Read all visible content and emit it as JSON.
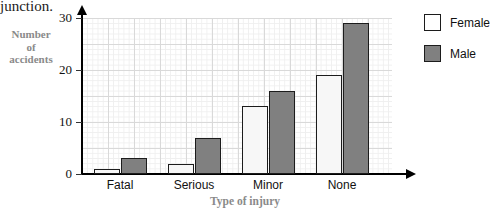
{
  "fragment_text": "junction.",
  "chart_data": {
    "type": "bar",
    "title": "",
    "xlabel": "Type of injury",
    "ylabel": "Number of accidents",
    "ylabel_lines": [
      "Number",
      "of",
      "accidents"
    ],
    "categories": [
      "Fatal",
      "Serious",
      "Minor",
      "None"
    ],
    "series": [
      {
        "name": "Female",
        "color": "#ffffff",
        "values": [
          1,
          2,
          13,
          19
        ]
      },
      {
        "name": "Male",
        "color": "#808080",
        "values": [
          3,
          7,
          16,
          29
        ]
      }
    ],
    "ylim": [
      0,
      30
    ],
    "yticks": [
      0,
      10,
      20,
      30
    ],
    "ytick_labels": [
      "0",
      "10",
      "20",
      "30"
    ],
    "grid": true,
    "grid_major_step": 5,
    "grid_minor_step": 1,
    "legend_position": "right"
  },
  "legend": {
    "items": [
      {
        "label": "Female",
        "swatch": "white-square"
      },
      {
        "label": "Male",
        "swatch": "gray-square"
      }
    ]
  },
  "colors": {
    "female_fill": "#f7f7f7",
    "male_fill": "#808080",
    "bar_outline": "#1c1c1c",
    "axis": "#000000",
    "grid_major": "#d9d9d9",
    "grid_minor": "#efefef",
    "axis_title": "#8a8a8a"
  }
}
